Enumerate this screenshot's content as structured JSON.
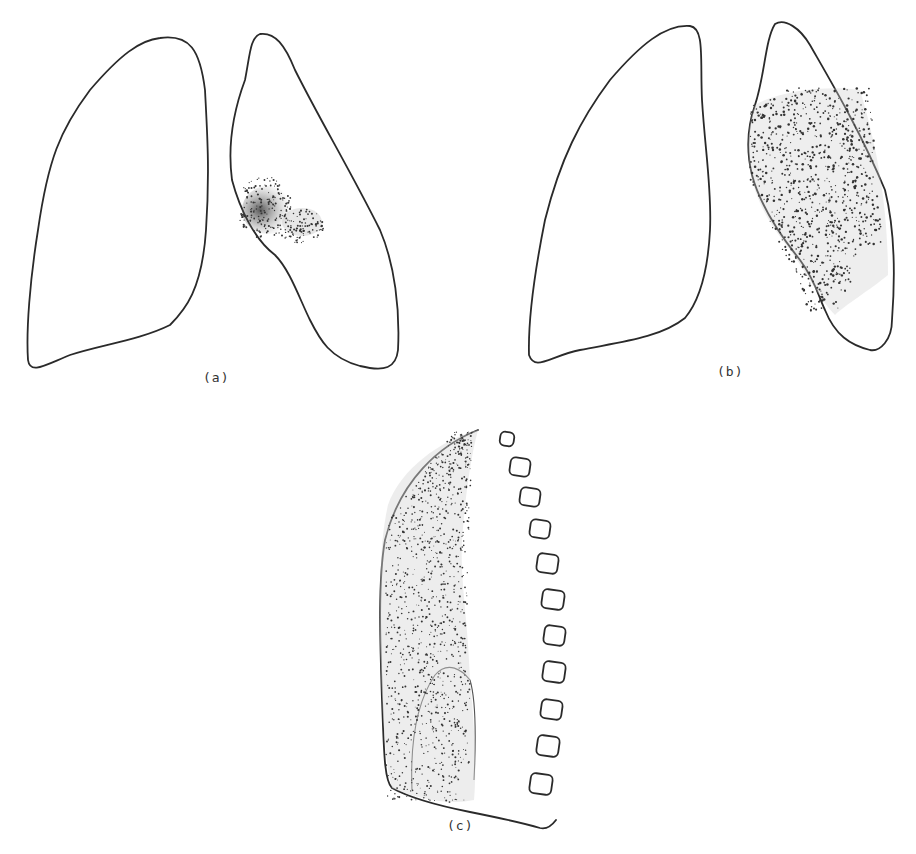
{
  "figure": {
    "panels": [
      {
        "id": "a",
        "caption": "(a)",
        "description": "Frontal view of both lungs; small dense opacity near the hilum of the right-hand lung"
      },
      {
        "id": "b",
        "caption": "(b)",
        "description": "Frontal view of both lungs; widespread stippled opacity across most of the right-hand lung"
      },
      {
        "id": "c",
        "caption": "(c)",
        "description": "Lateral view of a lung beside the vertebral column, with stippled opacity and a denser lower lobe region"
      }
    ],
    "ink_color": "#2a2a2a",
    "background": "#ffffff"
  }
}
